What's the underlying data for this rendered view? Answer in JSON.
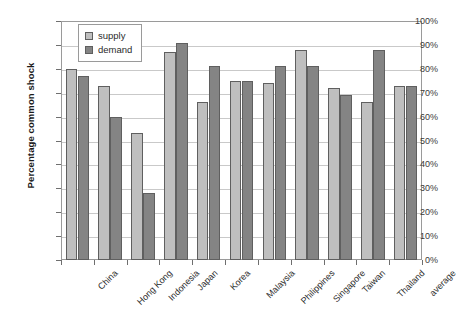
{
  "chart_data": {
    "type": "bar",
    "title": "",
    "xlabel": "",
    "ylabel": "Percentage common shock",
    "ylim": [
      0,
      100
    ],
    "ytick_labels": [
      "100%",
      "90%",
      "80%",
      "70%",
      "60%",
      "50%",
      "40%",
      "30%",
      "20%",
      "10%",
      "0%"
    ],
    "ytick_values": [
      100,
      90,
      80,
      70,
      60,
      50,
      40,
      30,
      20,
      10,
      0
    ],
    "grid": true,
    "legend_position": "top-left-inside",
    "categories": [
      "China",
      "Hong Kong",
      "Indonesia",
      "Japan",
      "Korea",
      "Malaysia",
      "Philippines",
      "Singapore",
      "Taiwan",
      "Thailand",
      "average"
    ],
    "series": [
      {
        "name": "supply",
        "color": "#bfbfbf",
        "values": [
          80,
          73,
          53,
          87,
          66,
          75,
          74,
          88,
          72,
          66,
          73
        ]
      },
      {
        "name": "demand",
        "color": "#848484",
        "values": [
          77,
          60,
          28,
          91,
          81,
          75,
          81,
          81,
          69,
          88,
          73
        ]
      }
    ]
  },
  "legend": {
    "items": [
      {
        "label": "supply"
      },
      {
        "label": "demand"
      }
    ]
  }
}
